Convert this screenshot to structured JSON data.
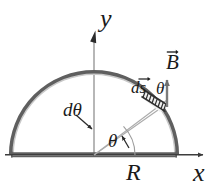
{
  "figure": {
    "background_color": "#ffffff",
    "width": 218,
    "height": 194,
    "axes": {
      "origin": {
        "x": 94,
        "y": 155
      },
      "x_axis": {
        "label": "x",
        "color": "#555555",
        "start": {
          "x": 5,
          "y": 155
        },
        "end": {
          "x": 207,
          "y": 155
        },
        "arrow": "right"
      },
      "y_axis": {
        "label": "y",
        "color": "#9a9a9a",
        "start": {
          "x": 94,
          "y": 155
        },
        "end": {
          "x": 94,
          "y": 31
        },
        "arrow": "up"
      }
    },
    "loop": {
      "shape": "semicircle",
      "radius_label": "R",
      "radius_px": 83,
      "stroke_color": "#6e6e6e",
      "inner_color": "#cfcfcf",
      "left_end": {
        "x": 11,
        "y": 155
      },
      "right_end": {
        "x": 177,
        "y": 155
      },
      "apex": {
        "x": 94,
        "y": 72
      }
    },
    "b_field": {
      "label": "B",
      "vector_notation": "arrow-over",
      "color": "#7b7b7b",
      "tail": {
        "x": 167,
        "y": 106
      },
      "tip": {
        "x": 167,
        "y": 76
      },
      "direction": "up"
    },
    "ds_element": {
      "label": "ds",
      "vector_notation": "arrow-over",
      "hatch_color": "#3a3a3a",
      "location": {
        "x": 158,
        "y": 100
      }
    },
    "angles": [
      {
        "name": "theta-at-origin",
        "label": "θ",
        "x": 108,
        "y": 131
      },
      {
        "name": "d-theta-wedge",
        "label": "dθ",
        "x": 63,
        "y": 100
      },
      {
        "name": "theta-at-ds",
        "label": "θ",
        "x": 156,
        "y": 80
      }
    ],
    "radial_lines": {
      "color": "#a8a8a8",
      "from": {
        "x": 94,
        "y": 155
      },
      "to_outer": {
        "x": 166,
        "y": 101
      },
      "to_inner": {
        "x": 156,
        "y": 109
      }
    },
    "leader_arrows": [
      {
        "name": "dtheta-leader",
        "from": {
          "x": 78,
          "y": 116
        },
        "to": {
          "x": 95,
          "y": 130
        }
      },
      {
        "name": "theta-leader",
        "from": {
          "x": 127,
          "y": 131
        },
        "to": {
          "x": 118,
          "y": 140
        }
      }
    ]
  }
}
